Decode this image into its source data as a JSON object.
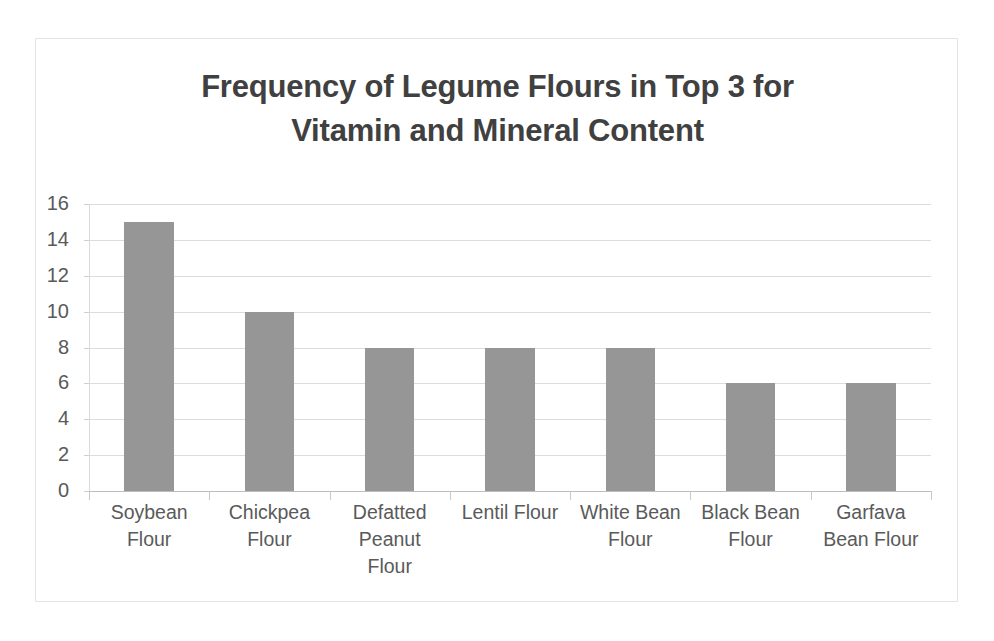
{
  "chart_data": {
    "type": "bar",
    "title": "Frequency of Legume Flours in Top 3 for Vitamin and Mineral Content",
    "title_lines": [
      "Frequency of Legume Flours in Top 3 for",
      "Vitamin and Mineral Content"
    ],
    "xlabel": "",
    "ylabel": "",
    "categories": [
      "Soybean Flour",
      "Chickpea Flour",
      "Defatted Peanut Flour",
      "Lentil Flour",
      "White Bean Flour",
      "Black Bean Flour",
      "Garfava Bean Flour"
    ],
    "category_label_lines": [
      [
        "Soybean",
        "Flour"
      ],
      [
        "Chickpea",
        "Flour"
      ],
      [
        "Defatted",
        "Peanut",
        "Flour"
      ],
      [
        "Lentil Flour"
      ],
      [
        "White Bean",
        "Flour"
      ],
      [
        "Black Bean",
        "Flour"
      ],
      [
        "Garfava",
        "Bean Flour"
      ]
    ],
    "values": [
      15,
      10,
      8,
      8,
      8,
      6,
      6
    ],
    "ylim": [
      0,
      16
    ],
    "yticks": [
      0,
      2,
      4,
      6,
      8,
      10,
      12,
      14,
      16
    ],
    "ytick_labels": [
      "0",
      "2",
      "4",
      "6",
      "8",
      "10",
      "12",
      "14",
      "16"
    ],
    "grid": true,
    "legend": false,
    "bar_color": "#969696",
    "title_color": "#404040",
    "tick_label_color": "#595959",
    "gridline_color": "#dcdcdc",
    "border_color": "#e3e3e3",
    "background_color": "#ffffff"
  }
}
